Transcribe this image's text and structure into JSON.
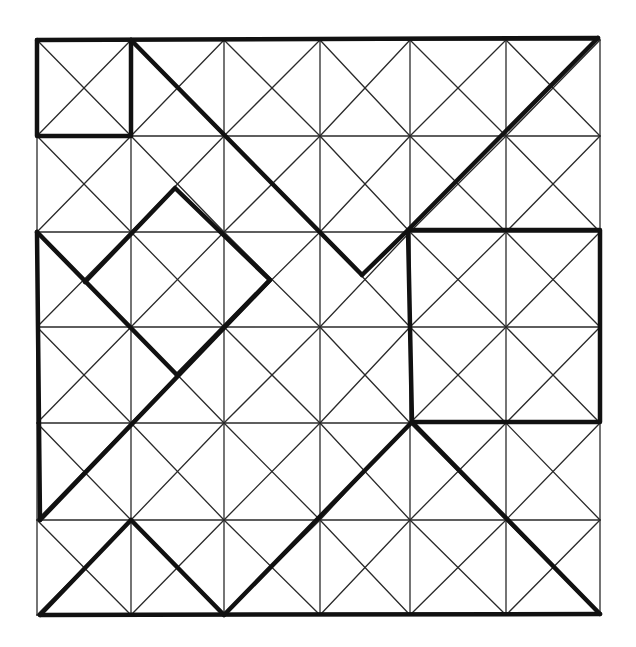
{
  "diagram": {
    "type": "grid-dissection-puzzle",
    "grid": {
      "rows": 6,
      "cols": 6,
      "x_lines": [
        37,
        131,
        224,
        320,
        410,
        506,
        600
      ],
      "y_lines": [
        40,
        136,
        232,
        327,
        423,
        520,
        615
      ],
      "cell_diagonals": true
    },
    "colors": {
      "background": "#ffffff",
      "thin_line": "#2a2a2a",
      "bold_line": "#111111"
    },
    "bold_segments": [
      {
        "name": "top-edge",
        "points": [
          [
            37,
            40
          ],
          [
            598,
            38
          ]
        ]
      },
      {
        "name": "bottom-edge",
        "points": [
          [
            40,
            615
          ],
          [
            600,
            614
          ]
        ]
      },
      {
        "name": "top-left-square",
        "points": [
          [
            37,
            40
          ],
          [
            37,
            136
          ],
          [
            131,
            136
          ],
          [
            131,
            40
          ]
        ]
      },
      {
        "name": "big-diagonal-down",
        "points": [
          [
            131,
            40
          ],
          [
            362,
            275
          ]
        ]
      },
      {
        "name": "v-up-to-corner",
        "points": [
          [
            362,
            275
          ],
          [
            408,
            230
          ],
          [
            598,
            38
          ]
        ]
      },
      {
        "name": "right-rectangle",
        "points": [
          [
            408,
            230
          ],
          [
            600,
            230
          ],
          [
            600,
            422
          ],
          [
            412,
            422
          ],
          [
            408,
            230
          ]
        ]
      },
      {
        "name": "lower-right-diagonal",
        "points": [
          [
            412,
            422
          ],
          [
            600,
            614
          ]
        ]
      },
      {
        "name": "center-bottom-diagonal",
        "points": [
          [
            224,
            615
          ],
          [
            412,
            422
          ]
        ]
      },
      {
        "name": "left-edge",
        "points": [
          [
            37,
            232
          ],
          [
            40,
            520
          ]
        ]
      },
      {
        "name": "left-triangle-diagonal",
        "points": [
          [
            37,
            232
          ],
          [
            177,
            375
          ]
        ]
      },
      {
        "name": "long-rising-diagonal",
        "points": [
          [
            40,
            520
          ],
          [
            270,
            280
          ]
        ]
      },
      {
        "name": "diamond",
        "points": [
          [
            85,
            282
          ],
          [
            175,
            188
          ],
          [
            270,
            280
          ],
          [
            177,
            375
          ]
        ]
      },
      {
        "name": "bottom-peak",
        "points": [
          [
            40,
            615
          ],
          [
            131,
            520
          ],
          [
            224,
            615
          ]
        ]
      }
    ]
  }
}
